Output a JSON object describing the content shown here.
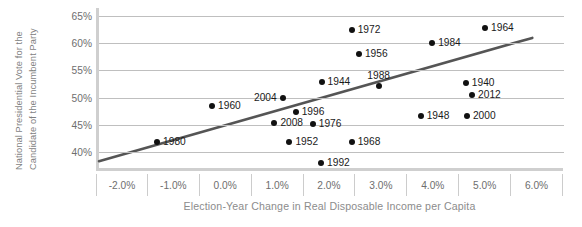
{
  "chart_data": {
    "type": "scatter",
    "title": "",
    "xlabel": "Election-Year Change in Real Disposable Income per Capita",
    "ylabel_line1": "National Presidential Vote for the",
    "ylabel_line2": "Candidate of the Incumbent Party",
    "xlim": [
      -2.5,
      6.5
    ],
    "ylim": [
      36.5,
      66.5
    ],
    "xticks": [
      "-2.0%",
      "-1.0%",
      "0.0%",
      "1.0%",
      "2.0%",
      "3.0%",
      "4.0%",
      "5.0%",
      "6.0%"
    ],
    "xtick_values": [
      -2.0,
      -1.0,
      0.0,
      1.0,
      2.0,
      3.0,
      4.0,
      5.0,
      6.0
    ],
    "yticks": [
      "40%",
      "45%",
      "50%",
      "55%",
      "60%",
      "65%"
    ],
    "ytick_values": [
      40,
      45,
      50,
      55,
      60,
      65
    ],
    "grid": "horizontal",
    "legend": "none",
    "point_color": "#111111",
    "trendline_color": "#555555",
    "gridline_color": "#bfbfbf",
    "axis_color": "#cfcfcf",
    "trendline": {
      "x0": -2.5,
      "y0": 38.3,
      "x1": 5.85,
      "y1": 61.0
    },
    "points": [
      {
        "label": "1980",
        "x": -1.38,
        "y": 41.9,
        "label_pos": "right"
      },
      {
        "label": "1960",
        "x": -0.32,
        "y": 48.5,
        "label_pos": "right"
      },
      {
        "label": "2004",
        "x": 1.04,
        "y": 50.0,
        "label_pos": "left"
      },
      {
        "label": "2008",
        "x": 0.88,
        "y": 45.3,
        "label_pos": "right"
      },
      {
        "label": "1952",
        "x": 1.17,
        "y": 41.9,
        "label_pos": "right"
      },
      {
        "label": "1996",
        "x": 1.29,
        "y": 47.4,
        "label_pos": "right"
      },
      {
        "label": "1976",
        "x": 1.62,
        "y": 45.1,
        "label_pos": "right"
      },
      {
        "label": "1944",
        "x": 1.79,
        "y": 52.9,
        "label_pos": "right"
      },
      {
        "label": "1992",
        "x": 1.78,
        "y": 38.0,
        "label_pos": "right"
      },
      {
        "label": "1972",
        "x": 2.37,
        "y": 62.4,
        "label_pos": "right"
      },
      {
        "label": "1968",
        "x": 2.37,
        "y": 41.9,
        "label_pos": "right"
      },
      {
        "label": "1956",
        "x": 2.51,
        "y": 58.0,
        "label_pos": "right"
      },
      {
        "label": "1988",
        "x": 2.89,
        "y": 52.1,
        "label_pos": "above"
      },
      {
        "label": "1948",
        "x": 3.7,
        "y": 46.6,
        "label_pos": "right"
      },
      {
        "label": "1984",
        "x": 3.92,
        "y": 60.1,
        "label_pos": "right"
      },
      {
        "label": "1940",
        "x": 4.57,
        "y": 52.7,
        "label_pos": "right"
      },
      {
        "label": "2000",
        "x": 4.59,
        "y": 46.6,
        "label_pos": "right"
      },
      {
        "label": "2012",
        "x": 4.69,
        "y": 50.4,
        "label_pos": "right"
      },
      {
        "label": "1964",
        "x": 4.94,
        "y": 62.8,
        "label_pos": "right"
      }
    ]
  }
}
